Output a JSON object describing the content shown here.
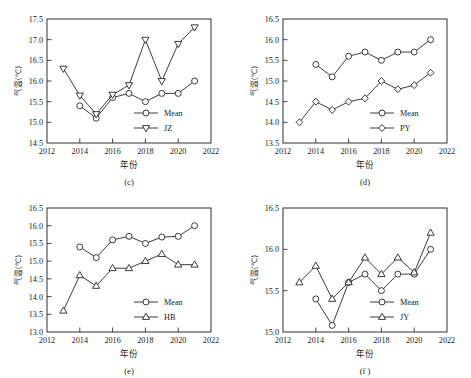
{
  "figure": {
    "axis_titles": {
      "x": "年份",
      "y": "气温(℃)"
    },
    "marker_shapes": {
      "circle": "circle",
      "down_triangle": "down-triangle",
      "diamond": "diamond",
      "up_triangle": "up-triangle"
    }
  },
  "chart_data": [
    {
      "type": "line",
      "panel": "(c)",
      "title": "",
      "xlabel": "年份",
      "ylabel": "气温(℃)",
      "xlim": [
        2012,
        2022
      ],
      "ylim": [
        14.5,
        17.5
      ],
      "xticks": [
        2012,
        2014,
        2016,
        2018,
        2020,
        2022
      ],
      "xticklabels": [
        "2012",
        "2014",
        "2016",
        "2018",
        "2020",
        "2022"
      ],
      "yticks": [
        14.5,
        15.0,
        15.5,
        16.0,
        16.5,
        17.0,
        17.5
      ],
      "yticklabels": [
        "14.5",
        "15.0",
        "15.5",
        "16.0",
        "16.5",
        "17.0",
        "17.5"
      ],
      "grid": false,
      "legend_position": "lower-right",
      "series": [
        {
          "name": "Mean",
          "marker": "circle",
          "x": [
            2014,
            2015,
            2016,
            2017,
            2018,
            2019,
            2020,
            2021
          ],
          "values": [
            15.4,
            15.1,
            15.6,
            15.7,
            15.5,
            15.7,
            15.7,
            16.0
          ]
        },
        {
          "name": "JZ",
          "marker": "down-triangle",
          "x": [
            2013,
            2014,
            2015,
            2016,
            2017,
            2018,
            2019,
            2020,
            2021
          ],
          "values": [
            16.3,
            15.65,
            15.2,
            15.67,
            15.9,
            17.0,
            16.0,
            16.9,
            17.3
          ]
        }
      ]
    },
    {
      "type": "line",
      "panel": "(d)",
      "title": "",
      "xlabel": "年份",
      "ylabel": "气温(℃)",
      "xlim": [
        2012,
        2022
      ],
      "ylim": [
        13.5,
        16.5
      ],
      "xticks": [
        2012,
        2014,
        2016,
        2018,
        2020,
        2022
      ],
      "xticklabels": [
        "2012",
        "2014",
        "2016",
        "2018",
        "2020",
        "2022"
      ],
      "yticks": [
        13.5,
        14.0,
        14.5,
        15.0,
        15.5,
        16.0,
        16.5
      ],
      "yticklabels": [
        "13.5",
        "14.0",
        "14.5",
        "15.0",
        "15.5",
        "16.0",
        "16.5"
      ],
      "grid": false,
      "legend_position": "lower-right",
      "series": [
        {
          "name": "Mean",
          "marker": "circle",
          "x": [
            2014,
            2015,
            2016,
            2017,
            2018,
            2019,
            2020,
            2021
          ],
          "values": [
            15.4,
            15.1,
            15.6,
            15.7,
            15.5,
            15.7,
            15.7,
            16.0
          ]
        },
        {
          "name": "PY",
          "marker": "diamond",
          "x": [
            2013,
            2014,
            2015,
            2016,
            2017,
            2018,
            2019,
            2020,
            2021
          ],
          "values": [
            14.0,
            14.5,
            14.3,
            14.5,
            14.58,
            15.0,
            14.8,
            14.9,
            15.2
          ]
        }
      ]
    },
    {
      "type": "line",
      "panel": "(e)",
      "title": "",
      "xlabel": "年份",
      "ylabel": "气温(℃)",
      "xlim": [
        2012,
        2022
      ],
      "ylim": [
        13.0,
        16.5
      ],
      "xticks": [
        2012,
        2014,
        2016,
        2018,
        2020,
        2022
      ],
      "xticklabels": [
        "2012",
        "2014",
        "2016",
        "2018",
        "2020",
        "2022"
      ],
      "yticks": [
        13.0,
        13.5,
        14.0,
        14.5,
        15.0,
        15.5,
        16.0,
        16.5
      ],
      "yticklabels": [
        "13.0",
        "13.5",
        "14.0",
        "14.5",
        "15.0",
        "15.5",
        "16.0",
        "16.5"
      ],
      "grid": false,
      "legend_position": "lower-right",
      "series": [
        {
          "name": "Mean",
          "marker": "circle",
          "x": [
            2014,
            2015,
            2016,
            2017,
            2018,
            2019,
            2020,
            2021
          ],
          "values": [
            15.4,
            15.1,
            15.6,
            15.7,
            15.5,
            15.68,
            15.7,
            16.0
          ]
        },
        {
          "name": "HB",
          "marker": "up-triangle",
          "x": [
            2013,
            2014,
            2015,
            2016,
            2017,
            2018,
            2019,
            2020,
            2021
          ],
          "values": [
            13.6,
            14.6,
            14.3,
            14.8,
            14.8,
            15.0,
            15.2,
            14.9,
            14.9
          ]
        }
      ]
    },
    {
      "type": "line",
      "panel": "(f )",
      "title": "",
      "xlabel": "年份",
      "ylabel": "气温(℃)",
      "xlim": [
        2012,
        2022
      ],
      "ylim": [
        15.0,
        16.5
      ],
      "xticks": [
        2012,
        2014,
        2016,
        2018,
        2020,
        2022
      ],
      "xticklabels": [
        "2012",
        "2014",
        "2016",
        "2018",
        "2020",
        "2022"
      ],
      "yticks": [
        15.0,
        15.5,
        16.0,
        16.5
      ],
      "yticklabels": [
        "15.0",
        "15.5",
        "16.0",
        "16.5"
      ],
      "grid": false,
      "legend_position": "lower-right",
      "series": [
        {
          "name": "Mean",
          "marker": "circle",
          "x": [
            2014,
            2015,
            2016,
            2017,
            2018,
            2019,
            2020,
            2021
          ],
          "values": [
            15.4,
            15.08,
            15.6,
            15.7,
            15.5,
            15.7,
            15.7,
            16.0
          ]
        },
        {
          "name": "JY",
          "marker": "up-triangle",
          "x": [
            2013,
            2014,
            2015,
            2016,
            2017,
            2018,
            2019,
            2020,
            2021
          ],
          "values": [
            15.6,
            15.8,
            15.4,
            15.6,
            15.9,
            15.7,
            15.9,
            15.72,
            16.2
          ]
        }
      ]
    }
  ]
}
